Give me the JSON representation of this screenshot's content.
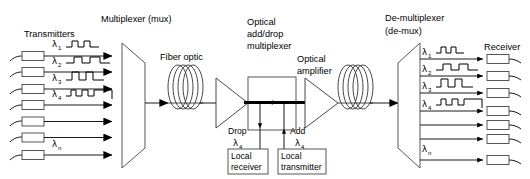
{
  "diagram": {
    "background_color": "#ffffff",
    "line_color": "#000000",
    "box_fill": "#ffffff"
  },
  "labels": {
    "transmitters": "Transmitters",
    "multiplexer": "Multiplexer (mux)",
    "fiber_optic": "Fiber optic",
    "oadm_line1": "Optical",
    "oadm_line2": "add/drop",
    "oadm_line3": "multiplexer",
    "amplifier_line1": "Optical",
    "amplifier_line2": "amplifier",
    "demux_line1": "De-multiplexer",
    "demux_line2": "(de-mux)",
    "receiver": "Receiver",
    "drop": "Drop",
    "drop_lambda": "λ",
    "drop_lambda_sub": "4",
    "add": "Add",
    "add_lambda": "λ",
    "add_lambda_sub": "4",
    "local_receiver_line1": "Local",
    "local_receiver_line2": "receiver",
    "local_transmitter_line1": "Local",
    "local_transmitter_line2": "transmitter"
  },
  "transmitter_channels": [
    {
      "lambda": "λ",
      "sub": "1",
      "has_wave": true
    },
    {
      "lambda": "λ",
      "sub": "2",
      "has_wave": true
    },
    {
      "lambda": "λ",
      "sub": "3",
      "has_wave": true
    },
    {
      "lambda": "λ",
      "sub": "4",
      "has_wave": true
    },
    {
      "lambda": "",
      "sub": "",
      "has_wave": false
    },
    {
      "lambda": "",
      "sub": "",
      "has_wave": false
    },
    {
      "lambda": "λ",
      "sub": "n",
      "has_wave": false
    }
  ],
  "receiver_channels": [
    {
      "lambda": "λ",
      "sub": "1",
      "has_wave": true
    },
    {
      "lambda": "λ",
      "sub": "2",
      "has_wave": true
    },
    {
      "lambda": "λ",
      "sub": "3",
      "has_wave": true
    },
    {
      "lambda": "λ",
      "sub": "4",
      "has_wave": true
    },
    {
      "lambda": "",
      "sub": "",
      "has_wave": false
    },
    {
      "lambda": "",
      "sub": "",
      "has_wave": false
    },
    {
      "lambda": "λ",
      "sub": "n",
      "has_wave": false
    }
  ],
  "components": {
    "mux_shape": "trapezoid-right-narrow",
    "demux_shape": "trapezoid-left-narrow",
    "fiber_icon": "coil-icon",
    "amplifier_icon": "triangle-right-icon",
    "oadm_icon": "rectangle-box-icon",
    "arrow_icon": "arrow-right-icon",
    "drop_arrow_icon": "arrow-down-icon",
    "add_arrow_icon": "arrow-up-icon"
  }
}
